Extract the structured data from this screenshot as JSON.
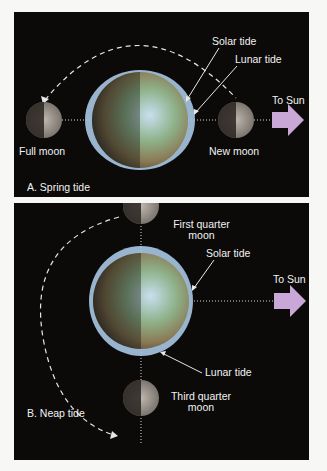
{
  "panel_a": {
    "caption": "A. Spring tide",
    "labels": {
      "solar_tide": "Solar tide",
      "lunar_tide": "Lunar tide",
      "to_sun": "To Sun",
      "full_moon": "Full moon",
      "new_moon": "New moon"
    }
  },
  "panel_b": {
    "caption": "B. Neap tide",
    "labels": {
      "first_quarter_line1": "First quarter",
      "first_quarter_line2": "moon",
      "solar_tide": "Solar tide",
      "to_sun": "To Sun",
      "lunar_tide": "Lunar tide",
      "third_quarter_line1": "Third quarter",
      "third_quarter_line2": "moon"
    }
  },
  "colors": {
    "background": "#0b0a09",
    "arrow_sun": "#c9a8d8",
    "tidal_bulge": "#a9c6e6",
    "text": "#f2f2f2"
  }
}
